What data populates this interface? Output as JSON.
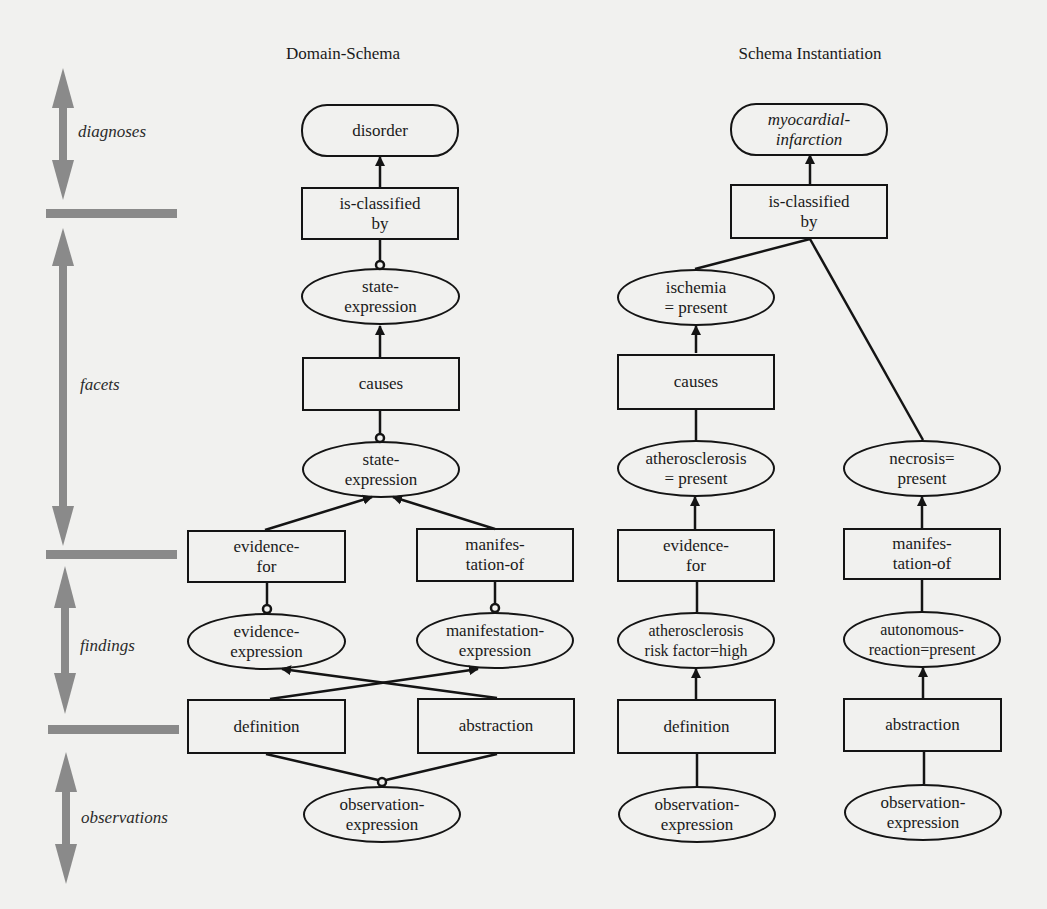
{
  "titles": {
    "domain_schema": "Domain-Schema",
    "schema_instantiation": "Schema Instantiation"
  },
  "levels": [
    {
      "label": "diagnoses"
    },
    {
      "label": "facets"
    },
    {
      "label": "findings"
    },
    {
      "label": "observations"
    }
  ],
  "domain_schema": {
    "disorder": "disorder",
    "is_classified_by": "is-classified\nby",
    "state_expression_1": "state-\nexpression",
    "causes": "causes",
    "state_expression_2": "state-\nexpression",
    "evidence_for": "evidence-\nfor",
    "manifestation_of": "manifes-\ntation-of",
    "evidence_expression": "evidence-\nexpression",
    "manifestation_expression": "manifestation-\nexpression",
    "definition": "definition",
    "abstraction": "abstraction",
    "observation_expression": "observation-\nexpression"
  },
  "schema_instantiation": {
    "myocardial_infarction": "myocardial-\ninfarction",
    "is_classified_by": "is-classified\nby",
    "ischemia": "ischemia\n= present",
    "causes": "causes",
    "atherosclerosis": "atherosclerosis\n= present",
    "necrosis": "necrosis=\npresent",
    "evidence_for": "evidence-\nfor",
    "manifestation_of": "manifes-\ntation-of",
    "atherosclerosis_risk": "atherosclerosis\nrisk factor=high",
    "autonomous_reaction": "autonomous-\nreaction=present",
    "definition": "definition",
    "abstraction": "abstraction",
    "observation_expression_left": "observation-\nexpression",
    "observation_expression_right": "observation-\nexpression"
  },
  "colors": {
    "background": "#f1f1ef",
    "stroke": "#141414",
    "level_arrow": "#8a8a8a"
  }
}
